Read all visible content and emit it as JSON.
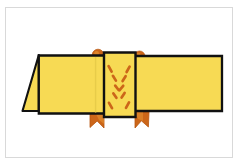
{
  "figure": {
    "title": "folded-paper-band-diagram",
    "background_color": "#ffffff",
    "frame_color": "#d9d9d9",
    "paper_fill": "#f7da54",
    "paper_fill_shade": "#f0d14a",
    "outline_color": "#111111",
    "accent_color": "#cc6619",
    "accent_color_dark": "#b8560f",
    "accent_color_light": "#e08a2e"
  },
  "parts": {
    "left_flap": {
      "label": "left-triangular-flap",
      "fill": "#f7da54",
      "points": "23,110.5 38.5,55.5 38.5,110.5"
    },
    "left_panel": {
      "label": "left-panel",
      "fill": "#f7da54",
      "points": "38.5,55.5 104,55.5 104,113.5 38.5,113.5"
    },
    "left_panel_fold_line": {
      "label": "left-panel-fold-line",
      "x": 95.5,
      "y1": 56,
      "y2": 113
    },
    "center_panel": {
      "label": "center-panel",
      "fill": "#f7da54",
      "points": "104,52 135,52 135,117 104,117"
    },
    "right_panel": {
      "label": "right-panel",
      "fill": "#f7da54",
      "points": "135,56 222,56 222,111 135,111"
    },
    "knobs": [
      {
        "label": "top-left-knob",
        "cx": 98,
        "cy": 55,
        "r": 5.6
      },
      {
        "label": "top-right-knob",
        "cx": 139.5,
        "cy": 56.5,
        "r": 5.2
      }
    ],
    "knob_stems": [
      {
        "label": "top-left-knob-stem",
        "points": "96,58.5 100.5,58.5 99.6,66 98.2,66"
      },
      {
        "label": "top-right-knob-stem",
        "points": "137.5,60 142,60 141,66.5 139.6,66.5"
      }
    ],
    "bottom_tabs": [
      {
        "label": "bottom-left-flag-tab",
        "points": "90,113 104,113 104,127.5 97.5,121.5 90,127"
      },
      {
        "label": "bottom-right-flag-tab",
        "points": "135,113 149,113 148.5,127 141.5,121 135,127.5"
      }
    ],
    "x_marks": {
      "label": "center-panel-x-dashes",
      "stroke": "#cc6619",
      "stroke_width": 2.6,
      "dashes": [
        {
          "x1": 108.5,
          "y1": 66.5,
          "x2": 111.5,
          "y2": 71.5
        },
        {
          "x1": 129.5,
          "y1": 67.0,
          "x2": 126.5,
          "y2": 72.0
        },
        {
          "x1": 113.0,
          "y1": 76.0,
          "x2": 116.0,
          "y2": 80.5
        },
        {
          "x1": 125.5,
          "y1": 76.5,
          "x2": 122.5,
          "y2": 81.0
        },
        {
          "x1": 115.0,
          "y1": 86.0,
          "x2": 118.5,
          "y2": 90.0
        },
        {
          "x1": 123.0,
          "y1": 86.0,
          "x2": 119.5,
          "y2": 90.0
        },
        {
          "x1": 113.5,
          "y1": 93.5,
          "x2": 116.5,
          "y2": 97.5
        },
        {
          "x1": 124.5,
          "y1": 93.0,
          "x2": 121.5,
          "y2": 97.5
        },
        {
          "x1": 109.0,
          "y1": 103.0,
          "x2": 112.0,
          "y2": 108.0
        },
        {
          "x1": 129.0,
          "y1": 102.5,
          "x2": 126.0,
          "y2": 107.5
        }
      ]
    }
  }
}
